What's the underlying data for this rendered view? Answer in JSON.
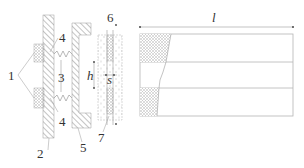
{
  "figure": {
    "type": "schematic diagram",
    "labels": {
      "magnet_group": "1",
      "base_plate": "2",
      "spring": "3",
      "spring_mount_top": "4",
      "spring_mount_bottom": "4",
      "frame": "5",
      "coil_top": "6",
      "coil_bottom": "7",
      "height_dim": "h",
      "gap_dim": "s",
      "length_dim": "l"
    },
    "colors": {
      "line": "#9a9a9a",
      "hatch": "#8a8a8a",
      "text": "#333333",
      "fill_dots": "#c8c8c8"
    }
  }
}
